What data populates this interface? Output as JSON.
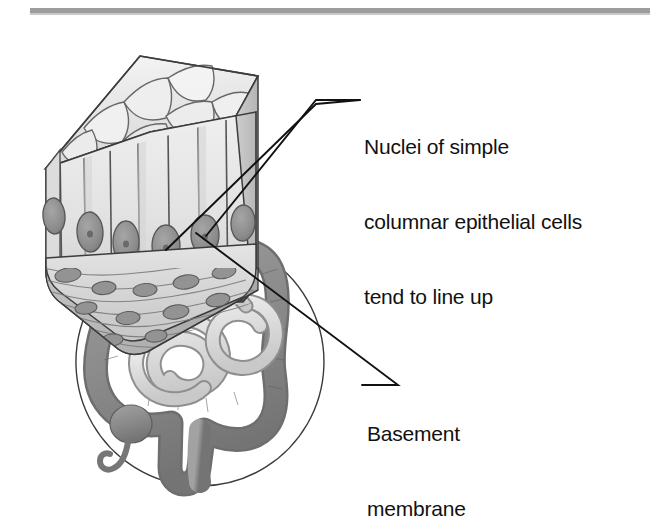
{
  "figure": {
    "title_rule": "top-divider",
    "background_color": "#ffffff",
    "line_color": "#1a1a1a"
  },
  "labels": {
    "nuclei": {
      "name": "nuclei-callout-label",
      "lines": [
        "Nuclei of simple",
        "columnar epithelial cells",
        "tend to line up"
      ]
    },
    "basement": {
      "name": "basement-membrane-callout-label",
      "lines": [
        "Basement",
        "membrane"
      ]
    }
  },
  "diagram": {
    "epithelium_block": {
      "name": "simple-columnar-epithelium-block",
      "description": "three-dimensional block of simple columnar epithelium",
      "apical_surface": "polygonal cell mosaic",
      "cell_count_front": 6,
      "nuclei_count_front": 6,
      "basement_layer": "basement membrane with connective tissue fibers and flattened nuclei"
    },
    "organ_inset": {
      "name": "intestine-circle-inset",
      "description": "circular inset of large and small intestine",
      "parts": [
        "large intestine",
        "small intestine",
        "cecum",
        "appendix",
        "rectum"
      ]
    },
    "leader_lines": [
      {
        "name": "leader-line-nuclei-upper",
        "from": "nucleus-right",
        "to": "nuclei-label"
      },
      {
        "name": "leader-line-nuclei-lower",
        "from": "nucleus-left",
        "to": "nuclei-label"
      },
      {
        "name": "leader-line-basement",
        "from": "basement-membrane",
        "to": "basement-label"
      }
    ]
  },
  "colors": {
    "outline": "#2b2b2b",
    "cell_fill_light": "#eeeeee",
    "cell_fill_mid": "#d8d8d8",
    "cell_fill_shadow": "#bdbdbd",
    "nucleus": "#8e8e8e",
    "nucleus_dark": "#6f6f6f",
    "large_intestine": "#8c8c8c",
    "small_intestine": "#d5d5d5",
    "rule": "#9a9a9a"
  }
}
